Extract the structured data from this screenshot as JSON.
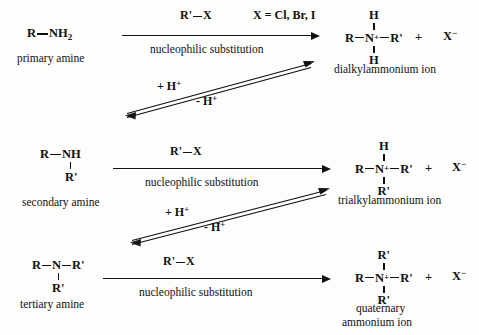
{
  "diagram": {
    "type": "reaction-scheme",
    "background_color": "#fdfdfc",
    "ink_color": "#111111"
  },
  "rows": [
    {
      "id": "primary",
      "reactant": {
        "formula_r": "R",
        "formula_n": "NH",
        "formula_sub": "2",
        "caption": "primary amine"
      },
      "arrow": {
        "reagent": "R'",
        "reagent_bond_to": "X",
        "condition_note": "X = Cl, Br, I",
        "mechanism": "nucleophilic substitution"
      },
      "product": {
        "top": "H",
        "left": "R",
        "center": "N",
        "charge": "+",
        "right": "R'",
        "bottom": "H",
        "plus": "+",
        "counterion": "X",
        "counterion_charge": "−",
        "caption": "dialkylammonium ion"
      }
    },
    {
      "id": "secondary",
      "reactant": {
        "formula_r": "R",
        "formula_n": "NH",
        "formula_sub": "",
        "below": "R'",
        "caption": "secondary amine"
      },
      "arrow": {
        "reagent": "R'",
        "reagent_bond_to": "X",
        "condition_note": "",
        "mechanism": "nucleophilic substitution"
      },
      "product": {
        "top": "H",
        "left": "R",
        "center": "N",
        "charge": "+",
        "right": "R'",
        "bottom": "R'",
        "plus": "+",
        "counterion": "X",
        "counterion_charge": "−",
        "caption": "trialkylammonium ion"
      }
    },
    {
      "id": "tertiary",
      "reactant": {
        "formula_r": "R",
        "formula_n": "N",
        "formula_right": "R'",
        "below": "R'",
        "caption": "tertiary amine"
      },
      "arrow": {
        "reagent": "R'",
        "reagent_bond_to": "X",
        "condition_note": "",
        "mechanism": "nucleophilic substitution"
      },
      "product": {
        "top": "R'",
        "left": "R",
        "center": "N",
        "charge": "+",
        "right": "R'",
        "bottom": "R'",
        "plus": "+",
        "counterion": "X",
        "counterion_charge": "−",
        "caption_line1": "quaternary",
        "caption_line2": "ammonium ion"
      }
    }
  ],
  "equilibria": [
    {
      "id": "eq-1",
      "label_above": "+ H",
      "label_above_sup": "+",
      "label_below": "- H",
      "label_below_sup": "+",
      "direction": "diagonal-up-right"
    },
    {
      "id": "eq-2",
      "label_above": "+ H",
      "label_above_sup": "+",
      "label_below": "- H",
      "label_below_sup": "+",
      "direction": "diagonal-up-right"
    }
  ]
}
